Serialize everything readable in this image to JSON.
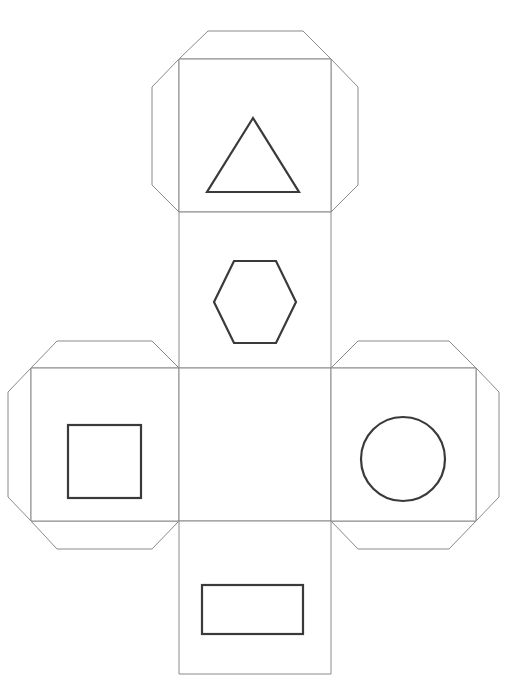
{
  "document": {
    "title": "Cube Net Template",
    "type": "papercraft-net",
    "background_color": "#ffffff",
    "fold_line_color": "#8a8a8a",
    "motif_stroke_color": "#3a3a3a",
    "page_width": 513,
    "page_height": 700
  },
  "margin_glyph": {
    "text": "t",
    "color": "#bdbdbd"
  },
  "net": {
    "layout_name": "cross-shaped cube net",
    "panel_count": 6,
    "grid": {
      "column_left": 179,
      "column_right": 331,
      "row_top": 368,
      "row_bottom": 521
    },
    "panels": [
      {
        "id": "top-panel",
        "name": "top-panel",
        "label": "Top face",
        "x": 179,
        "y": 59,
        "width": 152,
        "height": 153,
        "motif": "triangle",
        "motif_label": "Triangle",
        "flaps": [
          "top",
          "left",
          "right"
        ]
      },
      {
        "id": "upper-middle-panel",
        "name": "upper-middle-panel",
        "label": "Upper middle face",
        "x": 179,
        "y": 212,
        "width": 152,
        "height": 156,
        "motif": "hexagon",
        "motif_label": "Hexagon",
        "flaps": []
      },
      {
        "id": "left-panel",
        "name": "left-panel",
        "label": "Left face",
        "x": 31,
        "y": 368,
        "width": 148,
        "height": 153,
        "motif": "square",
        "motif_label": "Square",
        "flaps": [
          "top",
          "left",
          "bottom"
        ]
      },
      {
        "id": "center-panel",
        "name": "center-panel",
        "label": "Center face",
        "x": 179,
        "y": 368,
        "width": 152,
        "height": 153,
        "motif": "none",
        "motif_label": "Blank",
        "flaps": []
      },
      {
        "id": "right-panel",
        "name": "right-panel",
        "label": "Right face",
        "x": 331,
        "y": 368,
        "width": 145,
        "height": 153,
        "motif": "circle",
        "motif_label": "Circle",
        "flaps": [
          "top",
          "right",
          "bottom"
        ]
      },
      {
        "id": "bottom-panel",
        "name": "bottom-panel",
        "label": "Bottom face",
        "x": 179,
        "y": 521,
        "width": 152,
        "height": 153,
        "motif": "rectangle",
        "motif_label": "Rectangle",
        "flaps": []
      }
    ],
    "motifs": [
      {
        "shape": "triangle",
        "panel": "top-panel",
        "center_x": 253,
        "center_y": 155,
        "width": 92,
        "height": 74
      },
      {
        "shape": "hexagon",
        "panel": "upper-middle-panel",
        "center_x": 255,
        "center_y": 302,
        "width": 82,
        "height": 82
      },
      {
        "shape": "square",
        "panel": "left-panel",
        "center_x": 104,
        "center_y": 461,
        "width": 73,
        "height": 73
      },
      {
        "shape": "circle",
        "panel": "right-panel",
        "center_x": 403,
        "center_y": 459,
        "radius": 42
      },
      {
        "shape": "rectangle",
        "panel": "bottom-panel",
        "center_x": 252,
        "center_y": 609,
        "width": 101,
        "height": 49
      }
    ]
  }
}
